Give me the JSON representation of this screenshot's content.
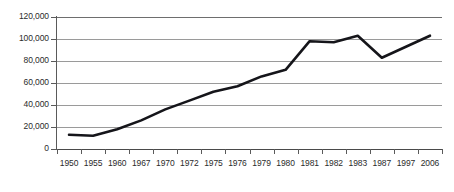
{
  "chart_data": {
    "type": "line",
    "title": "",
    "subtitle": "",
    "xlabel": "",
    "ylabel": "",
    "categories": [
      "1950",
      "1955",
      "1960",
      "1967",
      "1970",
      "1972",
      "1975",
      "1976",
      "1979",
      "1980",
      "1981",
      "1982",
      "1983",
      "1987",
      "1997",
      "2006"
    ],
    "series": [
      {
        "name": "Value",
        "values": [
          13000,
          12000,
          18000,
          26000,
          36000,
          44000,
          52000,
          57000,
          66000,
          72000,
          98000,
          97000,
          103000,
          83000,
          93000,
          103000
        ]
      }
    ],
    "ylim": [
      0,
      120000
    ],
    "y_ticks": [
      0,
      20000,
      40000,
      60000,
      80000,
      100000,
      120000
    ],
    "y_tick_labels": [
      "0",
      "20,000",
      "40,000",
      "60,000",
      "80,000",
      "100,000",
      "120,000"
    ],
    "grid": true,
    "grid_axis": "y",
    "legend": false,
    "legend_position": "none",
    "line_color": "#15151a",
    "grid_color": "#9a9a9a",
    "axis_color": "#5a5a5a",
    "background_color": "#ffffff",
    "annotations": []
  }
}
